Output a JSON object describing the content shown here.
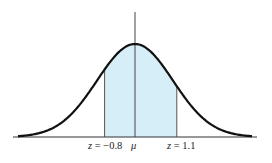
{
  "diagram": {
    "type": "normal-distribution-curve",
    "shaded_region": {
      "from_z": -0.8,
      "to_z": 1.1,
      "color": "#d6eef8"
    },
    "labels": {
      "left": {
        "var": "z",
        "eq": " = ",
        "val": "−0.8"
      },
      "mean": "μ",
      "right": {
        "var": "z",
        "eq": " = ",
        "val": "1.1"
      }
    },
    "colors": {
      "curve": "#111111",
      "axis": "#333333",
      "lines": "#555555",
      "fill": "#d6eef8"
    }
  }
}
